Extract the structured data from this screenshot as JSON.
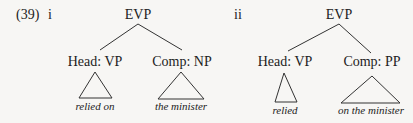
{
  "example": {
    "number": "(39)",
    "trees": [
      {
        "label": "i",
        "root": "EVP",
        "head": {
          "label": "Head: VP",
          "leaf": "relied on"
        },
        "comp": {
          "label": "Comp: NP",
          "leaf": "the minister"
        }
      },
      {
        "label": "ii",
        "root": "EVP",
        "head": {
          "label": "Head: VP",
          "leaf": "relied"
        },
        "comp": {
          "label": "Comp: PP",
          "leaf": "on the minister"
        }
      }
    ]
  },
  "colors": {
    "ink": "#222222",
    "background": "#f7f6f4"
  }
}
